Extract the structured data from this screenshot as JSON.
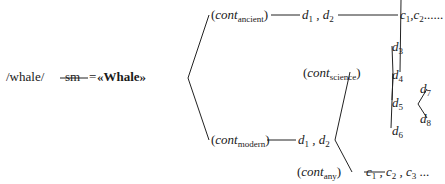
{
  "root": {
    "word": "/whale/",
    "sm": "sm",
    "eq": "=",
    "concept": "«Whale»"
  },
  "branches": {
    "ancient": {
      "cont": "cont",
      "sub": "ancient",
      "d": [
        "d",
        "1",
        "d",
        "2"
      ],
      "c": [
        "c",
        "1",
        "c",
        "2"
      ],
      "ellipsis": "......"
    },
    "modern": {
      "cont": "cont",
      "sub": "modern",
      "d": [
        "d",
        "1",
        "d",
        "2"
      ]
    },
    "science": {
      "cont": "cont",
      "sub": "science",
      "leaves": [
        {
          "d": "d",
          "n": "3"
        },
        {
          "d": "d",
          "n": "4"
        },
        {
          "d": "d",
          "n": "5"
        },
        {
          "d": "d",
          "n": "6"
        }
      ],
      "d5_children": [
        {
          "d": "d",
          "n": "7"
        },
        {
          "d": "d",
          "n": "8"
        }
      ]
    },
    "any": {
      "cont": "cont",
      "sub": "any",
      "c": [
        "c",
        "1",
        "c",
        "2",
        "c",
        "3"
      ],
      "ellipsis": "..."
    }
  },
  "punct": {
    "comma": ",",
    "open": "(",
    "close": ")"
  }
}
